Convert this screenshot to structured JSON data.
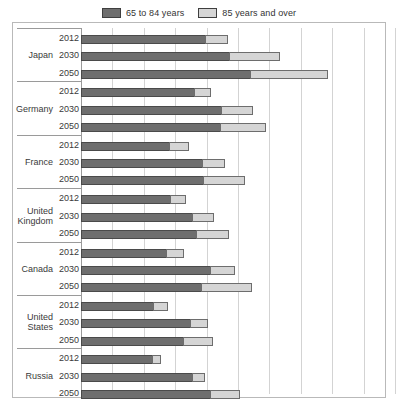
{
  "legend": {
    "entries": [
      {
        "label": "65 to 84 years",
        "color": "#6e6e6e",
        "icon": "square-swatch-icon"
      },
      {
        "label": "85 years and over",
        "color": "#d5d5d5",
        "icon": "square-swatch-icon"
      }
    ]
  },
  "chart_data": {
    "type": "bar",
    "orientation": "horizontal",
    "stacked": true,
    "title": "",
    "subtitle": "",
    "xlabel": "",
    "ylabel": "",
    "xlim": [
      0,
      50
    ],
    "xticks": [
      0,
      5,
      10,
      15,
      20,
      25,
      30,
      35,
      40,
      45,
      50
    ],
    "xtick_labels": [
      "",
      "",
      "",
      "",
      "",
      "",
      "",
      "",
      "",
      "",
      ""
    ],
    "grid": true,
    "legend_position": "top-center",
    "categories": [
      "Japan",
      "Germany",
      "France",
      "United Kingdom",
      "Canada",
      "United States",
      "Russia"
    ],
    "subcategories": [
      "2012",
      "2030",
      "2050"
    ],
    "series": [
      {
        "name": "65 to 84 years",
        "color": "#6e6e6e"
      },
      {
        "name": "85 years and over",
        "color": "#d5d5d5"
      }
    ],
    "groups": [
      {
        "country": "Japan",
        "country_display": "Japan",
        "rows": [
          {
            "year": "2012",
            "young": 19.9,
            "old": 3.5,
            "total": 23.4
          },
          {
            "year": "2030",
            "young": 23.7,
            "old": 8.0,
            "total": 31.7
          },
          {
            "year": "2050",
            "young": 27.1,
            "old": 12.3,
            "total": 39.4
          }
        ]
      },
      {
        "country": "Germany",
        "country_display": "Germany",
        "rows": [
          {
            "year": "2012",
            "young": 18.2,
            "old": 2.5,
            "total": 20.7
          },
          {
            "year": "2030",
            "young": 22.5,
            "old": 4.9,
            "total": 27.4
          },
          {
            "year": "2050",
            "young": 22.3,
            "old": 7.2,
            "total": 29.5
          }
        ]
      },
      {
        "country": "France",
        "country_display": "France",
        "rows": [
          {
            "year": "2012",
            "young": 14.2,
            "old": 3.0,
            "total": 17.2
          },
          {
            "year": "2030",
            "young": 19.4,
            "old": 3.5,
            "total": 22.9
          },
          {
            "year": "2050",
            "young": 19.6,
            "old": 6.5,
            "total": 26.1
          }
        ]
      },
      {
        "country": "United Kingdom",
        "country_display": "United\nKingdom",
        "rows": [
          {
            "year": "2012",
            "young": 14.3,
            "old": 2.5,
            "total": 16.8
          },
          {
            "year": "2030",
            "young": 17.8,
            "old": 3.3,
            "total": 21.1
          },
          {
            "year": "2050",
            "young": 18.4,
            "old": 5.2,
            "total": 23.6
          }
        ]
      },
      {
        "country": "Canada",
        "country_display": "Canada",
        "rows": [
          {
            "year": "2012",
            "young": 13.7,
            "old": 2.7,
            "total": 16.4
          },
          {
            "year": "2030",
            "young": 20.7,
            "old": 3.8,
            "total": 24.5
          },
          {
            "year": "2050",
            "young": 19.3,
            "old": 7.9,
            "total": 27.2
          }
        ]
      },
      {
        "country": "United States",
        "country_display": "United\nStates",
        "rows": [
          {
            "year": "2012",
            "young": 11.6,
            "old": 2.3,
            "total": 13.9
          },
          {
            "year": "2030",
            "young": 17.5,
            "old": 2.8,
            "total": 20.3
          },
          {
            "year": "2050",
            "young": 16.4,
            "old": 4.6,
            "total": 21.0
          }
        ]
      },
      {
        "country": "Russia",
        "country_display": "Russia",
        "rows": [
          {
            "year": "2012",
            "young": 11.5,
            "old": 1.3,
            "total": 12.8
          },
          {
            "year": "2030",
            "young": 17.8,
            "old": 1.9,
            "total": 19.7
          },
          {
            "year": "2050",
            "young": 20.7,
            "old": 4.6,
            "total": 25.3
          }
        ]
      }
    ]
  }
}
